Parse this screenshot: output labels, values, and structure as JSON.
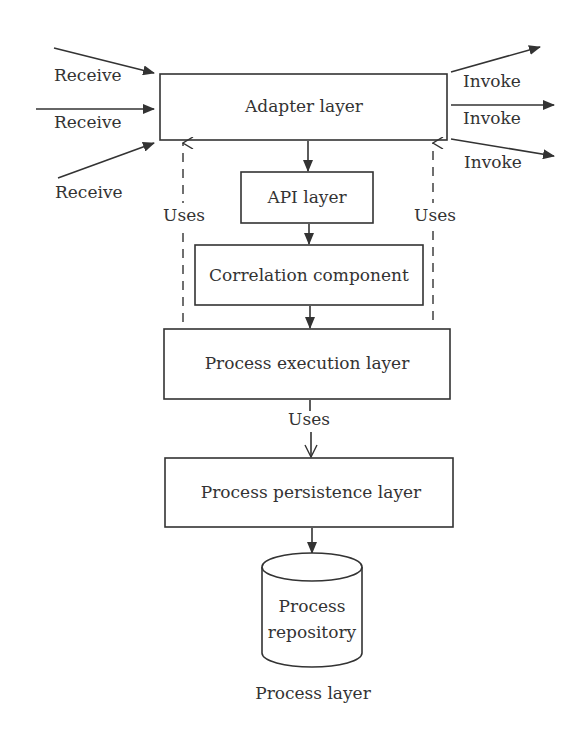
{
  "diagram": {
    "caption": "Process layer",
    "boxes": {
      "adapter": "Adapter layer",
      "api": "API layer",
      "correlation": "Correlation component",
      "execution": "Process execution layer",
      "persistence": "Process persistence layer"
    },
    "repository": {
      "line1": "Process",
      "line2": "repository"
    },
    "inputs": [
      "Receive",
      "Receive",
      "Receive"
    ],
    "outputs": [
      "Invoke",
      "Invoke",
      "Invoke"
    ],
    "uses_labels": {
      "left": "Uses",
      "right": "Uses",
      "bottom": "Uses"
    },
    "colors": {
      "stroke": "#333333",
      "background": "#ffffff"
    }
  }
}
